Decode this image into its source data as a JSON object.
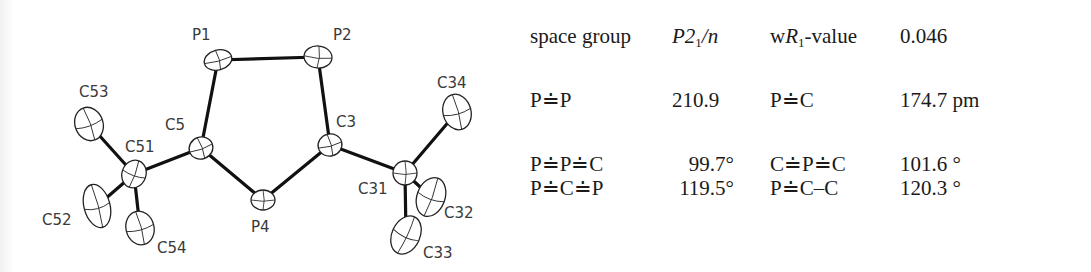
{
  "figure": {
    "type": "ORTEP crystal structure",
    "atoms": [
      {
        "id": "P1",
        "x": 218,
        "y": 60,
        "rx": 14,
        "ry": 10,
        "rot": -15,
        "lx": 192,
        "ly": 40
      },
      {
        "id": "P2",
        "x": 318,
        "y": 57,
        "rx": 14,
        "ry": 11,
        "rot": 5,
        "lx": 333,
        "ly": 40
      },
      {
        "id": "C5",
        "x": 201,
        "y": 148,
        "rx": 12,
        "ry": 11,
        "rot": -20,
        "lx": 165,
        "ly": 130
      },
      {
        "id": "C3",
        "x": 330,
        "y": 145,
        "rx": 12,
        "ry": 11,
        "rot": -15,
        "lx": 336,
        "ly": 127
      },
      {
        "id": "P4",
        "x": 263,
        "y": 200,
        "rx": 12,
        "ry": 10,
        "rot": 0,
        "lx": 251,
        "ly": 232
      },
      {
        "id": "C51",
        "x": 134,
        "y": 174,
        "rx": 12,
        "ry": 14,
        "rot": 20,
        "lx": 125,
        "ly": 152
      },
      {
        "id": "C53",
        "x": 89,
        "y": 124,
        "rx": 14,
        "ry": 17,
        "rot": -20,
        "lx": 79,
        "ly": 97
      },
      {
        "id": "C52",
        "x": 97,
        "y": 206,
        "rx": 13,
        "ry": 22,
        "rot": -15,
        "lx": 42,
        "ly": 225
      },
      {
        "id": "C54",
        "x": 140,
        "y": 228,
        "rx": 14,
        "ry": 17,
        "rot": -15,
        "lx": 157,
        "ly": 253
      },
      {
        "id": "C31",
        "x": 405,
        "y": 173,
        "rx": 12,
        "ry": 12,
        "rot": 0,
        "lx": 358,
        "ly": 194
      },
      {
        "id": "C34",
        "x": 457,
        "y": 112,
        "rx": 14,
        "ry": 18,
        "rot": -15,
        "lx": 437,
        "ly": 88
      },
      {
        "id": "C32",
        "x": 431,
        "y": 197,
        "rx": 14,
        "ry": 20,
        "rot": 20,
        "lx": 444,
        "ly": 218
      },
      {
        "id": "C33",
        "x": 406,
        "y": 235,
        "rx": 14,
        "ry": 20,
        "rot": 25,
        "lx": 423,
        "ly": 258
      }
    ],
    "bonds": [
      [
        "P1",
        "P2"
      ],
      [
        "P1",
        "C5"
      ],
      [
        "P2",
        "C3"
      ],
      [
        "C5",
        "P4"
      ],
      [
        "C3",
        "P4"
      ],
      [
        "C5",
        "C51"
      ],
      [
        "C51",
        "C53"
      ],
      [
        "C51",
        "C52"
      ],
      [
        "C51",
        "C54"
      ],
      [
        "C3",
        "C31"
      ],
      [
        "C31",
        "C34"
      ],
      [
        "C31",
        "C32"
      ],
      [
        "C31",
        "C33"
      ]
    ]
  },
  "table": {
    "rows": [
      {
        "label1": "space group",
        "value1_main": "P2",
        "value1_sub": "1",
        "value1_tail": "/n",
        "label2_pre": "w",
        "label2_italic": "R",
        "label2_sub": "1",
        "label2_post": "-value",
        "value2": "0.046"
      },
      {
        "label1": "P≐P",
        "value1": "210.9",
        "label2": "P≐C",
        "value2": "174.7 pm"
      },
      {
        "label1": "P≐P≐C",
        "value1": "99.7°",
        "label2": "C≐P≐C",
        "value2": "101.6 °"
      },
      {
        "label1": "P≐C≐P",
        "value1": "119.5°",
        "label2": "P≐C–C",
        "value2": "120.3 °"
      }
    ]
  }
}
